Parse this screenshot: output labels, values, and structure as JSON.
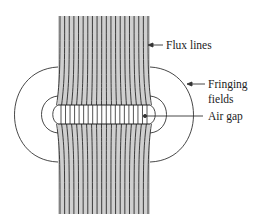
{
  "labels": {
    "flux_lines": "Flux lines",
    "fringing_line1": "Fringing",
    "fringing_line2": "fields",
    "air_gap": "Air gap"
  },
  "geometry": {
    "core_left": 58,
    "core_right": 150,
    "core_top": 16,
    "core_bottom": 214,
    "gap_top": 105,
    "gap_bottom": 124,
    "flux_line_count": 20
  },
  "colors": {
    "core_fill": "#cfcfcf",
    "line": "#2a2a2a",
    "gap_fill": "#ffffff"
  }
}
